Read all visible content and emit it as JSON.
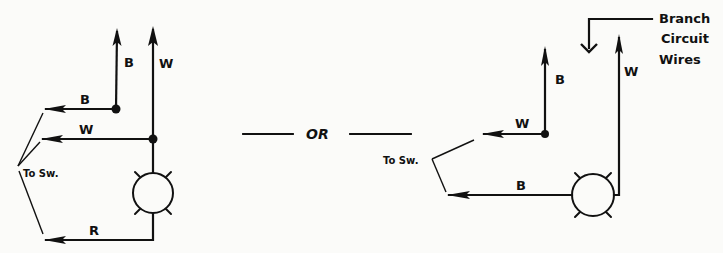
{
  "diagram": {
    "left": {
      "labels": {
        "b_vertical": "B",
        "w_vertical": "W",
        "b_horizontal": "B",
        "w_horizontal": "W",
        "r_horizontal": "R",
        "to_switch": "To Sw."
      }
    },
    "separator": {
      "text": "OR"
    },
    "right": {
      "labels": {
        "b_vertical": "B",
        "w_vertical": "W",
        "w_horizontal": "W",
        "b_horizontal": "B",
        "to_switch": "To Sw.",
        "branch_line1": "Branch",
        "branch_line2": "Circuit",
        "branch_line3": "Wires"
      }
    },
    "colors": {
      "ink": "#111111",
      "paper": "#fbfbf9"
    }
  }
}
